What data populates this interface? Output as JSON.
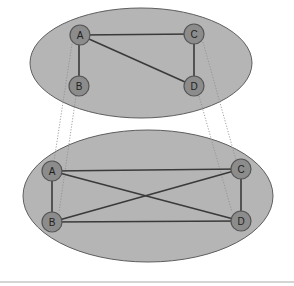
{
  "diagram": {
    "type": "graph-zoom-in",
    "colors": {
      "ellipse_fill": "#b5b5b5",
      "node_fill": "#8c8c8c",
      "edge": "#3a3a3a"
    },
    "top_graph": {
      "nodes": [
        {
          "id": "A",
          "label": "A"
        },
        {
          "id": "B",
          "label": "B"
        },
        {
          "id": "C",
          "label": "C"
        },
        {
          "id": "D",
          "label": "D"
        }
      ],
      "edges": [
        [
          "A",
          "C"
        ],
        [
          "A",
          "B"
        ],
        [
          "A",
          "D"
        ],
        [
          "C",
          "D"
        ]
      ]
    },
    "bottom_graph": {
      "nodes": [
        {
          "id": "A",
          "label": "A"
        },
        {
          "id": "B",
          "label": "B"
        },
        {
          "id": "C",
          "label": "C"
        },
        {
          "id": "D",
          "label": "D"
        }
      ],
      "edges": [
        [
          "A",
          "C"
        ],
        [
          "A",
          "B"
        ],
        [
          "A",
          "D"
        ],
        [
          "B",
          "C"
        ],
        [
          "B",
          "D"
        ],
        [
          "C",
          "D"
        ]
      ]
    },
    "projection_lines": [
      [
        "A",
        "A"
      ],
      [
        "B",
        "B"
      ],
      [
        "C",
        "C"
      ],
      [
        "D",
        "D"
      ]
    ]
  }
}
